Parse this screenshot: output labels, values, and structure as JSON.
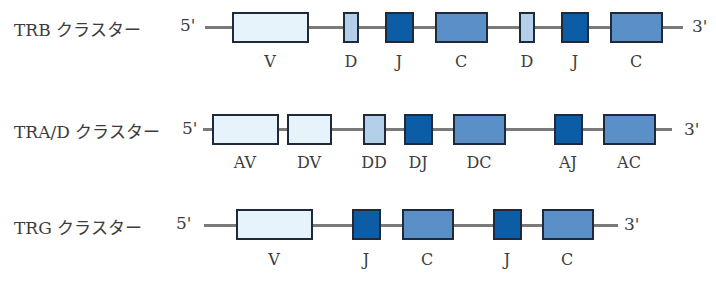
{
  "colors": {
    "v_segment": "#e6f3fb",
    "d_segment": "#b4cfe9",
    "j_segment": "#0d5da6",
    "c_segment": "#5a8fc8",
    "strand": "#7a7a7a",
    "border": "#1e2a3a"
  },
  "clusters": [
    {
      "name": "TRB クラスター",
      "five_prime": "5'",
      "three_prime": "3'",
      "segments": [
        {
          "label": "V",
          "type": "v"
        },
        {
          "label": "D",
          "type": "d"
        },
        {
          "label": "J",
          "type": "j"
        },
        {
          "label": "C",
          "type": "c"
        },
        {
          "label": "D",
          "type": "d"
        },
        {
          "label": "J",
          "type": "j"
        },
        {
          "label": "C",
          "type": "c"
        }
      ]
    },
    {
      "name": "TRA/D クラスター",
      "five_prime": "5'",
      "three_prime": "3'",
      "segments": [
        {
          "label": "AV",
          "type": "v"
        },
        {
          "label": "DV",
          "type": "v"
        },
        {
          "label": "DD",
          "type": "d"
        },
        {
          "label": "DJ",
          "type": "j"
        },
        {
          "label": "DC",
          "type": "c"
        },
        {
          "label": "AJ",
          "type": "j"
        },
        {
          "label": "AC",
          "type": "c"
        }
      ]
    },
    {
      "name": "TRG クラスター",
      "five_prime": "5'",
      "three_prime": "3'",
      "segments": [
        {
          "label": "V",
          "type": "v"
        },
        {
          "label": "J",
          "type": "j"
        },
        {
          "label": "C",
          "type": "c"
        },
        {
          "label": "J",
          "type": "j"
        },
        {
          "label": "C",
          "type": "c"
        }
      ]
    }
  ]
}
